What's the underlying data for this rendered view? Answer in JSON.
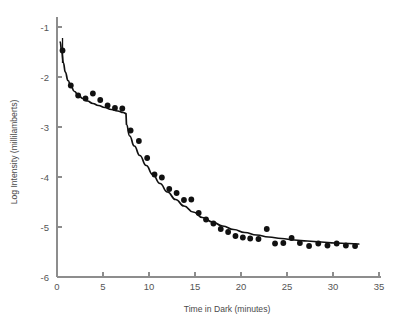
{
  "figure": {
    "background_color": "#ffffff",
    "axis_color": "#8d8d8d",
    "data_color": "#111111",
    "tick_label_color": "#555555"
  },
  "axes": {
    "x_title": "Time in Dark (minutes)",
    "y_title": "Log Intensity (millilamberts)",
    "x_ticks": [
      "0",
      "5",
      "10",
      "15",
      "20",
      "25",
      "30",
      "35"
    ],
    "y_ticks": [
      "-1",
      "-2",
      "-3",
      "-4",
      "-5",
      "-6"
    ]
  },
  "chart_data": {
    "type": "scatter",
    "title": "",
    "subtitle": "",
    "xlabel": "Time in Dark (minutes)",
    "ylabel": "Log Intensity (millilamberts)",
    "xlim": [
      0,
      35
    ],
    "ylim": [
      -6,
      -1
    ],
    "xticks": [
      0,
      5,
      10,
      15,
      20,
      25,
      30,
      35
    ],
    "yticks": [
      -6,
      -5,
      -4,
      -3,
      -2,
      -1
    ],
    "grid": false,
    "legend": null,
    "legend_position": "none",
    "annotations": [
      "Cone-rod break near 7.5 minutes",
      "Vertical error bar on first data point at 0.6 min"
    ],
    "series": [
      {
        "name": "Measured thresholds",
        "marker": "filled-circle",
        "color": "#111111",
        "x": [
          0.6,
          1.5,
          2.3,
          3.1,
          3.9,
          4.7,
          5.5,
          6.3,
          7.1,
          8.0,
          8.9,
          9.8,
          10.6,
          11.4,
          12.2,
          13.0,
          13.8,
          14.6,
          15.4,
          16.2,
          17.0,
          17.8,
          18.6,
          19.4,
          20.2,
          21.0,
          21.9,
          22.8,
          23.7,
          24.6,
          25.5,
          26.4,
          27.4,
          28.4,
          29.4,
          30.4,
          31.4,
          32.4
        ],
        "y": [
          -1.47,
          -2.17,
          -2.37,
          -2.43,
          -2.33,
          -2.46,
          -2.57,
          -2.62,
          -2.63,
          -3.07,
          -3.28,
          -3.62,
          -3.95,
          -4.01,
          -4.24,
          -4.32,
          -4.46,
          -4.45,
          -4.72,
          -4.85,
          -4.93,
          -5.04,
          -5.1,
          -5.18,
          -5.21,
          -5.23,
          -5.24,
          -5.04,
          -5.33,
          -5.32,
          -5.22,
          -5.32,
          -5.38,
          -5.33,
          -5.37,
          -5.33,
          -5.37,
          -5.38
        ]
      }
    ],
    "fitted_curve": {
      "name": "Two-branch dark adaptation fit",
      "color": "#111111",
      "x": [
        0.35,
        0.5,
        0.7,
        0.9,
        1.2,
        1.5,
        1.9,
        2.3,
        2.8,
        3.3,
        3.9,
        4.5,
        5.2,
        5.9,
        6.6,
        7.2,
        7.5,
        7.55,
        7.9,
        8.4,
        9.0,
        9.7,
        10.4,
        11.2,
        12.0,
        12.9,
        13.8,
        14.8,
        15.8,
        16.9,
        18.0,
        19.2,
        20.4,
        21.7,
        23.0,
        24.4,
        25.8,
        27.2,
        28.7,
        30.2,
        31.7,
        32.8
      ],
      "y": [
        -1.3,
        -1.48,
        -1.72,
        -1.9,
        -2.07,
        -2.18,
        -2.29,
        -2.36,
        -2.43,
        -2.48,
        -2.53,
        -2.57,
        -2.61,
        -2.65,
        -2.68,
        -2.71,
        -2.73,
        -2.95,
        -3.18,
        -3.38,
        -3.57,
        -3.77,
        -3.95,
        -4.13,
        -4.3,
        -4.45,
        -4.58,
        -4.7,
        -4.81,
        -4.9,
        -4.98,
        -5.05,
        -5.11,
        -5.16,
        -5.2,
        -5.23,
        -5.26,
        -5.28,
        -5.3,
        -5.32,
        -5.33,
        -5.34
      ]
    },
    "error_bars": [
      {
        "x": 0.6,
        "y": -1.47,
        "y_low": -1.72,
        "y_high": -1.22
      }
    ]
  }
}
